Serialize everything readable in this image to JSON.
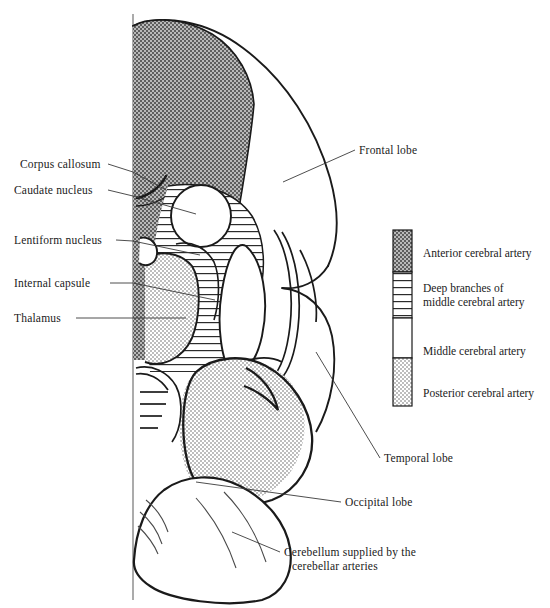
{
  "figure": {
    "midline_label": "midline"
  },
  "structure_labels": [
    {
      "name": "corpus-callosum",
      "text": "Corpus callosum",
      "x": 20,
      "y": 158,
      "align": "left",
      "leader": [
        [
          108,
          164
        ],
        [
          133,
          172
        ],
        [
          166,
          190
        ]
      ]
    },
    {
      "name": "caudate-nucleus",
      "text": "Caudate nucleus",
      "x": 14,
      "y": 184,
      "align": "left",
      "leader": [
        [
          108,
          190
        ],
        [
          133,
          196
        ],
        [
          196,
          214
        ]
      ]
    },
    {
      "name": "lentiform-nucleus",
      "text": "Lentiform nucleus",
      "x": 14,
      "y": 234,
      "align": "left",
      "leader": [
        [
          116,
          240
        ],
        [
          133,
          241
        ],
        [
          200,
          255
        ]
      ]
    },
    {
      "name": "internal-capsule",
      "text": "Internal capsule",
      "x": 14,
      "y": 277,
      "align": "left",
      "leader": [
        [
          110,
          283
        ],
        [
          133,
          283
        ],
        [
          215,
          300
        ]
      ]
    },
    {
      "name": "thalamus",
      "text": "Thalamus",
      "x": 14,
      "y": 312,
      "align": "left",
      "leader": [
        [
          76,
          318
        ],
        [
          133,
          318
        ],
        [
          186,
          318
        ]
      ]
    }
  ],
  "lobe_labels": [
    {
      "name": "frontal-lobe",
      "text": "Frontal lobe",
      "x": 358,
      "y": 144,
      "leader": [
        [
          355,
          150
        ],
        [
          283,
          182
        ]
      ]
    },
    {
      "name": "temporal-lobe",
      "text": "Temporal lobe",
      "x": 383,
      "y": 452,
      "leader": [
        [
          380,
          458
        ],
        [
          316,
          352
        ]
      ]
    },
    {
      "name": "occipital-lobe",
      "text": "Occipital lobe",
      "x": 344,
      "y": 496,
      "leader": [
        [
          341,
          502
        ],
        [
          196,
          482
        ]
      ]
    }
  ],
  "caption": {
    "name": "cerebellum-caption",
    "line1": "Cerebellum supplied by the",
    "line2": "cerebellar arteries",
    "x": 283,
    "y": 546,
    "leader": [
      [
        280,
        552
      ],
      [
        232,
        532
      ]
    ]
  },
  "legend": {
    "bar": {
      "x": 393,
      "y": 230,
      "width": 19,
      "height": 176
    },
    "items": [
      {
        "name": "anterior-cerebral-artery",
        "label_line1": "Anterior cerebral artery",
        "label_line2": "",
        "fill": "solid-dark",
        "color": "#8a8a8a",
        "seg_top": 230,
        "seg_height": 42,
        "text_y": 248
      },
      {
        "name": "deep-branches-middle-cerebral-artery",
        "label_line1": "Deep branches of",
        "label_line2": "middle cerebral artery",
        "fill": "horizontal-hatch",
        "color": "#ffffff",
        "seg_top": 272,
        "seg_height": 46,
        "text_y": 282
      },
      {
        "name": "middle-cerebral-artery",
        "label_line1": "Middle cerebral  artery",
        "label_line2": "",
        "fill": "white",
        "color": "#ffffff",
        "seg_top": 318,
        "seg_height": 40,
        "text_y": 352
      },
      {
        "name": "posterior-cerebral-artery",
        "label_line1": "Posterior cerebral  artery",
        "label_line2": "",
        "fill": "stipple",
        "color": "#cccccc",
        "seg_top": 358,
        "seg_height": 48,
        "text_y": 392
      }
    ]
  },
  "colors": {
    "anterior": "#8a8a8a",
    "posterior": "#cfcfcf",
    "outline": "#1a1a1a",
    "hatch": "#2b2b2b",
    "background": "#ffffff"
  }
}
